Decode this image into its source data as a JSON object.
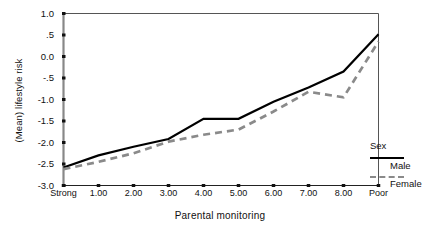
{
  "chart_data": {
    "type": "line",
    "title": "",
    "xlabel": "Parental monitoring",
    "ylabel": "(Mean) lifestyle risk",
    "categories": [
      "Strong",
      "1.00",
      "2.00",
      "3.00",
      "4.00",
      "5.00",
      "6.00",
      "7.00",
      "8.00",
      "Poor"
    ],
    "ylim": [
      -3.0,
      1.0
    ],
    "yticks": [
      1.0,
      0.5,
      0.0,
      -0.5,
      -1.0,
      -1.5,
      -2.0,
      -2.5,
      -3.0
    ],
    "ytick_labels": [
      "1.0",
      ".5",
      "0.0",
      "-.5",
      "-1.0",
      "-1.5",
      "-2.0",
      "-2.5",
      "-3.0"
    ],
    "grid": false,
    "legend_position": "right",
    "legend_title": "Sex",
    "series": [
      {
        "name": "Male",
        "style": "solid",
        "color": "#000000",
        "values": [
          -2.58,
          -2.3,
          -2.1,
          -1.92,
          -1.45,
          -1.45,
          -1.05,
          -0.72,
          -0.35,
          0.52
        ]
      },
      {
        "name": "Female",
        "style": "dashed",
        "color": "#8a8a8a",
        "values": [
          -2.62,
          -2.45,
          -2.25,
          -1.98,
          -1.82,
          -1.7,
          -1.28,
          -0.82,
          -0.95,
          0.35
        ]
      }
    ]
  },
  "legend": {
    "title": "Sex",
    "items": [
      {
        "label": "Male"
      },
      {
        "label": "Female"
      }
    ]
  }
}
